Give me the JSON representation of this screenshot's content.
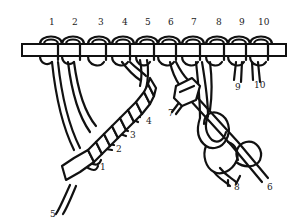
{
  "figure": {
    "stroke_color": "#111111",
    "background": "#ffffff"
  },
  "top_labels": [
    {
      "text": "1",
      "x": 51,
      "y": 25
    },
    {
      "text": "2",
      "x": 74,
      "y": 25
    },
    {
      "text": "3",
      "x": 100,
      "y": 25
    },
    {
      "text": "4",
      "x": 124,
      "y": 25
    },
    {
      "text": "5",
      "x": 147,
      "y": 25
    },
    {
      "text": "6",
      "x": 170,
      "y": 25
    },
    {
      "text": "7",
      "x": 193,
      "y": 25
    },
    {
      "text": "8",
      "x": 218,
      "y": 25
    },
    {
      "text": "9",
      "x": 241,
      "y": 25
    },
    {
      "text": "10",
      "x": 260,
      "y": 25
    }
  ],
  "end_labels": [
    {
      "text": "1",
      "x": 100,
      "y": 170
    },
    {
      "text": "2",
      "x": 116,
      "y": 150
    },
    {
      "text": "3",
      "x": 130,
      "y": 137
    },
    {
      "text": "4",
      "x": 146,
      "y": 124
    },
    {
      "text": "5",
      "x": 51,
      "y": 216
    },
    {
      "text": "7",
      "x": 170,
      "y": 115
    },
    {
      "text": "9",
      "x": 236,
      "y": 89
    },
    {
      "text": "10",
      "x": 255,
      "y": 87
    },
    {
      "text": "8",
      "x": 235,
      "y": 189
    },
    {
      "text": "6",
      "x": 268,
      "y": 189
    }
  ]
}
